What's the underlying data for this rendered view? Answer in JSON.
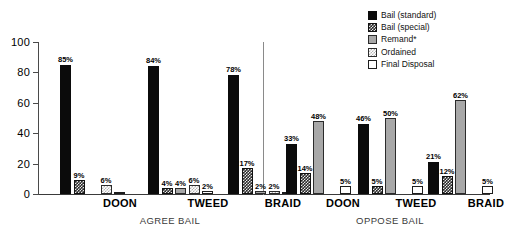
{
  "chart_data": {
    "type": "bar",
    "title": "",
    "xlabel": "",
    "ylabel": "",
    "ylim": [
      0,
      100
    ],
    "yticks": [
      "0",
      "20",
      "40",
      "60",
      "80",
      "100"
    ],
    "grid": false,
    "legend_position": "top-right",
    "sections": [
      {
        "name": "AGREE BAIL",
        "categories": [
          "DOON",
          "TWEED",
          "BRAID"
        ]
      },
      {
        "name": "OPPOSE BAIL",
        "categories": [
          "DOON",
          "TWEED",
          "BRAID"
        ]
      }
    ],
    "categories": [
      "AGREE BAIL / DOON",
      "AGREE BAIL / TWEED",
      "AGREE BAIL / BRAID",
      "OPPOSE BAIL / DOON",
      "OPPOSE BAIL / TWEED",
      "OPPOSE BAIL / BRAID"
    ],
    "series": [
      {
        "name": "Bail (standard)",
        "pattern": "solid-black",
        "color": "#0b0b0b",
        "values": [
          85,
          84,
          78,
          33,
          46,
          21
        ],
        "labels": [
          "85%",
          "84%",
          "78%",
          "33%",
          "46%",
          "21%"
        ]
      },
      {
        "name": "Bail (special)",
        "pattern": "check-dark",
        "color": "#2a2a2a",
        "values": [
          9,
          4,
          17,
          14,
          5,
          12
        ],
        "labels": [
          "9%",
          "4%",
          "17%",
          "14%",
          "5%",
          "12%"
        ]
      },
      {
        "name": "Remand*",
        "pattern": "gray-solid",
        "color": "#a8a8a8",
        "values": [
          0,
          4,
          2,
          48,
          50,
          62
        ],
        "labels": [
          "",
          "4%",
          "2%",
          "48%",
          "50%",
          "62%"
        ]
      },
      {
        "name": "Ordained",
        "pattern": "check-light",
        "color": "#b4b4b4",
        "values": [
          6,
          6,
          2,
          0,
          0,
          0
        ],
        "labels": [
          "6%",
          "6%",
          "2%",
          "",
          "",
          ""
        ]
      },
      {
        "name": "Final Disposal",
        "pattern": "white",
        "color": "#ffffff",
        "values": [
          1,
          2,
          1,
          5,
          5,
          5
        ],
        "labels": [
          "",
          "2%",
          "",
          "5%",
          "5%",
          "5%"
        ]
      }
    ]
  },
  "legend": {
    "items": [
      {
        "label": "Bail (standard)"
      },
      {
        "label": "Bail (special)"
      },
      {
        "label": "Remand*"
      },
      {
        "label": "Ordained"
      },
      {
        "label": "Final Disposal"
      }
    ]
  }
}
